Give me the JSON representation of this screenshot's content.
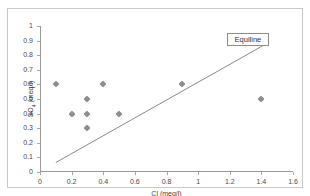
{
  "figure": {
    "scan_artifact_text": "· · · · · · · · · · · · · · · · · · · ·"
  },
  "legend": {
    "label": "Equiline"
  },
  "chart_data": {
    "type": "scatter",
    "title": "",
    "xlabel": "Cl (meq/l)",
    "ylabel": "SO4 (meq/l)",
    "ylabel_base": "SO",
    "ylabel_sub": "4",
    "ylabel_unit": " (meq/l)",
    "xlim": [
      0,
      1.6
    ],
    "ylim": [
      0,
      1
    ],
    "xticks": [
      0,
      0.2,
      0.4,
      0.6,
      0.8,
      1,
      1.2,
      1.4,
      1.6
    ],
    "xtick_labels": [
      "0",
      "0.2",
      "0.4",
      "0.6",
      "0.8",
      "1",
      "1.2",
      "1.4",
      "1.6"
    ],
    "yticks": [
      0,
      0.1,
      0.2,
      0.3,
      0.4,
      0.5,
      0.6,
      0.7,
      0.8,
      0.9,
      1
    ],
    "ytick_labels": [
      "0",
      "0.1",
      "0.2",
      "0.3",
      "0.4",
      "0.5",
      "0.6",
      "0.7",
      "0.8",
      "0.9",
      "1"
    ],
    "grid": false,
    "legend_position": "top-right",
    "marker_color": "#8d8d8d",
    "marker_shape": "diamond",
    "line_color": "#8a8a8a",
    "axis_color": "#9a9a9a",
    "series": [
      {
        "name": "samples",
        "points": [
          {
            "x": 0.1,
            "y": 0.6
          },
          {
            "x": 0.2,
            "y": 0.4
          },
          {
            "x": 0.3,
            "y": 0.5
          },
          {
            "x": 0.3,
            "y": 0.4
          },
          {
            "x": 0.3,
            "y": 0.3
          },
          {
            "x": 0.4,
            "y": 0.6
          },
          {
            "x": 0.5,
            "y": 0.4
          },
          {
            "x": 0.9,
            "y": 0.6
          },
          {
            "x": 1.4,
            "y": 0.5
          }
        ]
      },
      {
        "name": "Equiline",
        "type": "line",
        "points": [
          {
            "x": 0.1,
            "y": 0.065
          },
          {
            "x": 1.45,
            "y": 0.89
          }
        ]
      }
    ],
    "annotations": [
      {
        "name": "Equiline",
        "text": "Equiline",
        "x": 1.18,
        "y": 0.955
      }
    ]
  }
}
